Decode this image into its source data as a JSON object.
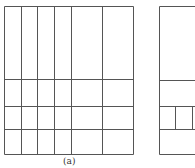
{
  "figure": {
    "caption": "(a)",
    "line_color": "#555555",
    "left_grid": {
      "x": [
        4,
        21,
        37,
        54,
        71,
        102,
        133
      ],
      "y": [
        6,
        79,
        106,
        129,
        154
      ]
    },
    "right_partial": {
      "left": 159,
      "top": 6,
      "bottom": 154,
      "right": 195,
      "h_lines": [
        80,
        106,
        129
      ],
      "row_v_lines": [
        175,
        192
      ],
      "row_v_span": [
        106,
        129
      ]
    }
  }
}
